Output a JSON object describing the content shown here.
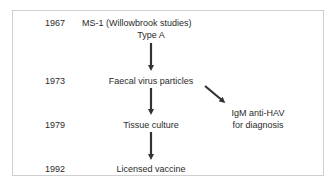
{
  "diagram": {
    "rows": [
      {
        "year": "1967",
        "label": "MS-1 (Willowbrook studies)",
        "sublabel": "Type A"
      },
      {
        "year": "1973",
        "label": "Faecal virus particles"
      },
      {
        "year": "1979",
        "label": "Tissue culture"
      },
      {
        "year": "1992",
        "label": "Licensed vaccine"
      }
    ],
    "branch": {
      "line1": "IgM anti-HAV",
      "line2": "for diagnosis"
    },
    "colors": {
      "text": "#2b2b2b",
      "arrow": "#333333",
      "border": "#cfcfcf"
    }
  }
}
